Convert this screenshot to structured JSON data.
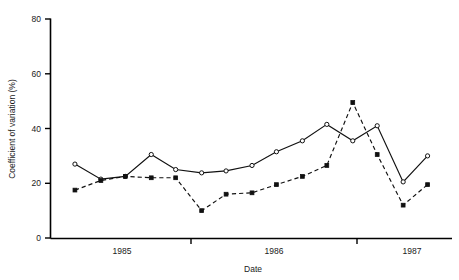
{
  "chart_data": {
    "type": "line",
    "title": "",
    "subtitle": "",
    "xlabel": "Date",
    "ylabel": "Coefficient of variation (%)",
    "ylim": [
      0,
      80
    ],
    "yticks": [
      0,
      20,
      40,
      60,
      80
    ],
    "ytick_labels": [
      "0",
      "20",
      "40",
      "60",
      "80"
    ],
    "xlim": [
      1984.72,
      1987.35
    ],
    "xticks": [
      1985.0,
      1985.5,
      1986.0,
      1986.5,
      1987.0
    ],
    "xtick_labels": [
      "1985",
      "",
      "1986",
      "",
      "1987"
    ],
    "xtick_labels_shown": [
      "1985",
      "1986",
      "1987"
    ],
    "grid": false,
    "legend": "none",
    "legend_position": "none",
    "annotations": [],
    "series": [
      {
        "name": "series-1",
        "line_style": "solid",
        "marker": "open-circle",
        "color": "#111111",
        "x": [
          1984.88,
          1985.05,
          1985.21,
          1985.38,
          1985.54,
          1985.71,
          1985.87,
          1986.04,
          1986.2,
          1986.37,
          1986.53,
          1986.7,
          1986.86,
          1987.03,
          1987.19
        ],
        "values": [
          27.0,
          21.5,
          22.5,
          30.5,
          25.0,
          23.8,
          24.5,
          26.5,
          31.5,
          35.5,
          41.5,
          35.5,
          41.0,
          20.5,
          30.0
        ]
      },
      {
        "name": "series-2",
        "line_style": "dashed",
        "marker": "filled-square",
        "color": "#111111",
        "x": [
          1984.88,
          1985.05,
          1985.21,
          1985.38,
          1985.54,
          1985.71,
          1985.87,
          1986.04,
          1986.2,
          1986.37,
          1986.53,
          1986.7,
          1986.86,
          1987.03,
          1987.19
        ],
        "values": [
          17.5,
          21.0,
          22.5,
          22.0,
          22.0,
          10.0,
          16.0,
          16.5,
          19.5,
          22.5,
          26.5,
          49.5,
          30.5,
          12.0,
          19.5
        ]
      }
    ]
  },
  "axes": {
    "ylabel": "Coefficient of variation (%)",
    "xlabel": "Date"
  }
}
